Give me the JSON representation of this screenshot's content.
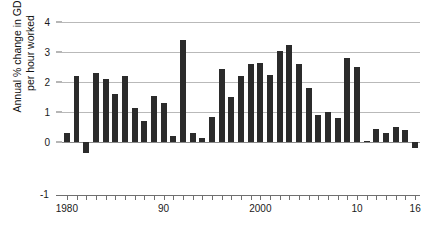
{
  "chart_data": {
    "type": "bar",
    "title": "",
    "subtitle": "",
    "xlabel": "",
    "ylabel": "Annual % change in GDP per hour worked",
    "ylabel_line1": "Annual % change in GDP",
    "ylabel_line2": "per hour worked",
    "ylim": [
      -1,
      4
    ],
    "ytick_values": [
      4,
      3,
      2,
      1,
      0,
      -1
    ],
    "ytick_labels": [
      "4",
      "3",
      "2",
      "1",
      "0",
      "-1"
    ],
    "grid": true,
    "gridline_values": [
      4,
      3,
      2,
      1,
      0
    ],
    "legend": "none",
    "bar_color": "#2b2b2b",
    "xlim": [
      1979.5,
      2016.5
    ],
    "xtick_years": [
      1980,
      1981,
      1982,
      1983,
      1984,
      1985,
      1986,
      1987,
      1988,
      1989,
      1990,
      1991,
      1992,
      1993,
      1994,
      1995,
      1996,
      1997,
      1998,
      1999,
      2000,
      2001,
      2002,
      2003,
      2004,
      2005,
      2006,
      2007,
      2008,
      2009,
      2010,
      2011,
      2012,
      2013,
      2014,
      2015,
      2016
    ],
    "xtick_labels": [
      {
        "year": 1980,
        "label": "1980"
      },
      {
        "year": 1990,
        "label": "90"
      },
      {
        "year": 2000,
        "label": "2000"
      },
      {
        "year": 2010,
        "label": "10"
      },
      {
        "year": 2016,
        "label": "16"
      }
    ],
    "categories": [
      "1980",
      "1981",
      "1982",
      "1983",
      "1984",
      "1985",
      "1986",
      "1987",
      "1988",
      "1989",
      "1990",
      "1991",
      "1992",
      "1993",
      "1994",
      "1995",
      "1996",
      "1997",
      "1998",
      "1999",
      "2000",
      "2001",
      "2002",
      "2003",
      "2004",
      "2005",
      "2006",
      "2007",
      "2008",
      "2009",
      "2010",
      "2011",
      "2012",
      "2013",
      "2014",
      "2015",
      "2016"
    ],
    "values": [
      0.3,
      2.2,
      -0.35,
      2.3,
      2.1,
      1.6,
      2.2,
      1.15,
      0.7,
      1.55,
      1.3,
      0.2,
      3.4,
      0.3,
      0.15,
      0.85,
      2.45,
      1.5,
      2.2,
      2.6,
      2.65,
      2.25,
      3.05,
      3.25,
      2.6,
      1.8,
      0.9,
      1.0,
      0.8,
      2.8,
      2.5,
      0.05,
      0.45,
      0.3,
      0.5,
      0.4,
      -0.2
    ]
  }
}
